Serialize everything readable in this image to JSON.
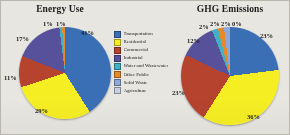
{
  "figure": {
    "background_color": "#e8e6e1",
    "border_color": "#b9b6ae"
  },
  "legend": {
    "position": "center",
    "items": [
      {
        "label": "Transportation",
        "color": "#3a6fb5"
      },
      {
        "label": "Residential",
        "color": "#f5ee23"
      },
      {
        "label": "Commercial",
        "color": "#b5432e"
      },
      {
        "label": "Industrial",
        "color": "#57519b"
      },
      {
        "label": "Water and Wastewater",
        "color": "#43b0c4"
      },
      {
        "label": "Other Public",
        "color": "#e58a2b"
      },
      {
        "label": "Solid Waste",
        "color": "#8fa8d8"
      },
      {
        "label": "Agriculture",
        "color": "#c8cfe4"
      }
    ]
  },
  "chart_data": [
    {
      "type": "pie",
      "title": "Energy Use",
      "categories": [
        "Transportation",
        "Residential",
        "Commercial",
        "Industrial",
        "Water and Wastewater",
        "Other Public",
        "Solid Waste",
        "Agriculture"
      ],
      "values": [
        41,
        29,
        11,
        17,
        1,
        1,
        0,
        0
      ],
      "colors": [
        "#3a6fb5",
        "#f5ee23",
        "#b5432e",
        "#57519b",
        "#43b0c4",
        "#e58a2b",
        "#8fa8d8",
        "#c8cfe4"
      ],
      "labels": [
        {
          "text": "41%",
          "x": 62,
          "y": 2
        },
        {
          "text": "29%",
          "x": 16,
          "y": 80
        },
        {
          "text": "11%",
          "x": -15,
          "y": 47
        },
        {
          "text": "17%",
          "x": -3,
          "y": 8
        },
        {
          "text": "1%",
          "x": 24,
          "y": -7
        },
        {
          "text": "1%",
          "x": 37,
          "y": -7
        }
      ]
    },
    {
      "type": "pie",
      "title": "GHG Emissions",
      "categories": [
        "Transportation",
        "Residential",
        "Commercial",
        "Industrial",
        "Water and Wastewater",
        "Other Public",
        "Solid Waste",
        "Agriculture"
      ],
      "values": [
        23,
        36,
        23,
        12,
        2,
        2,
        2,
        0
      ],
      "colors": [
        "#3a6fb5",
        "#f5ee23",
        "#b5432e",
        "#57519b",
        "#43b0c4",
        "#e58a2b",
        "#8fa8d8",
        "#c8cfe4"
      ],
      "labels": [
        {
          "text": "23%",
          "x": 79,
          "y": 5
        },
        {
          "text": "36%",
          "x": 66,
          "y": 86
        },
        {
          "text": "23%",
          "x": -9,
          "y": 62
        },
        {
          "text": "12%",
          "x": 6,
          "y": 10
        },
        {
          "text": "2%",
          "x": 18,
          "y": -4
        },
        {
          "text": "2%",
          "x": 29,
          "y": -7
        },
        {
          "text": "2%",
          "x": 40,
          "y": -7
        },
        {
          "text": "0%",
          "x": 51,
          "y": -7
        }
      ]
    }
  ]
}
